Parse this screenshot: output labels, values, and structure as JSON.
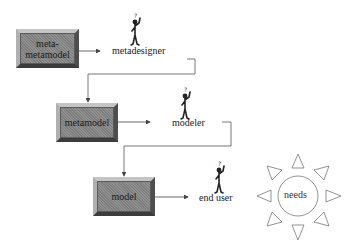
{
  "diagram": {
    "levels": [
      {
        "box_label": "meta-\nmetamodel",
        "box_label_lines": [
          "meta-",
          "metamodel"
        ],
        "actor": "metadesigner"
      },
      {
        "box_label": "metamodel",
        "actor": "modeler"
      },
      {
        "box_label": "model",
        "actor": "end user"
      }
    ],
    "needs": {
      "label": "needs",
      "icon": "sun-icon"
    },
    "actor_icon": "person-thinking-icon",
    "colors": {
      "box_fill": "#8f8f8f",
      "box_light": "#c4c4c4",
      "box_dark": "#3c3c3c",
      "line": "#444444",
      "sun_stroke": "#777777"
    }
  }
}
